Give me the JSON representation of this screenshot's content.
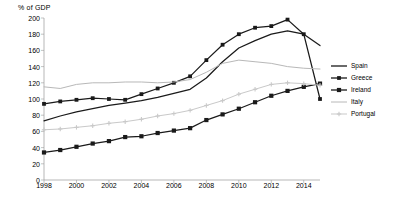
{
  "chart_data": {
    "type": "line",
    "title": "",
    "ylabel": "% of GDP",
    "xlabel": "",
    "ylim": [
      0,
      200
    ],
    "ytick_step": 20,
    "yticks": [
      0,
      20,
      40,
      60,
      80,
      100,
      120,
      140,
      160,
      180,
      200
    ],
    "xlim": [
      1998,
      2015
    ],
    "xticks": [
      1998,
      2000,
      2002,
      2004,
      2006,
      2008,
      2010,
      2012,
      2014
    ],
    "x": [
      1998,
      1999,
      2000,
      2001,
      2002,
      2003,
      2004,
      2005,
      2006,
      2007,
      2008,
      2009,
      2010,
      2011,
      2012,
      2013,
      2014,
      2015
    ],
    "grid": false,
    "legend_position": "right",
    "series": [
      {
        "name": "Spain",
        "color": "#1a1a1a",
        "marker": "none",
        "values": [
          73,
          79,
          84,
          88,
          92,
          95,
          98,
          102,
          107,
          112,
          126,
          146,
          163,
          172,
          180,
          184,
          180,
          166
        ]
      },
      {
        "name": "Greece",
        "color": "#1a1a1a",
        "marker": "square",
        "values": [
          94,
          97,
          99,
          101,
          100,
          99,
          106,
          113,
          120,
          128,
          148,
          167,
          180,
          188,
          190,
          198,
          180,
          100
        ]
      },
      {
        "name": "Ireland",
        "color": "#1a1a1a",
        "marker": "diamond",
        "values": [
          34,
          37,
          41,
          45,
          48,
          53,
          54,
          58,
          61,
          64,
          74,
          81,
          88,
          96,
          104,
          110,
          115,
          119
        ]
      },
      {
        "name": "Italy",
        "color": "#b8b8b8",
        "marker": "none",
        "values": [
          115,
          113,
          118,
          120,
          120,
          121,
          121,
          120,
          121,
          124,
          133,
          144,
          148,
          146,
          144,
          140,
          138,
          137
        ]
      },
      {
        "name": "Portugal",
        "color": "#c9c9c9",
        "marker": "cross",
        "values": [
          62,
          63,
          65,
          67,
          70,
          72,
          75,
          79,
          82,
          86,
          92,
          98,
          106,
          112,
          118,
          120,
          119,
          117
        ]
      }
    ],
    "legend_entries": [
      "Spain",
      "Greece",
      "Ireland",
      "Italy",
      "Portugal"
    ]
  }
}
